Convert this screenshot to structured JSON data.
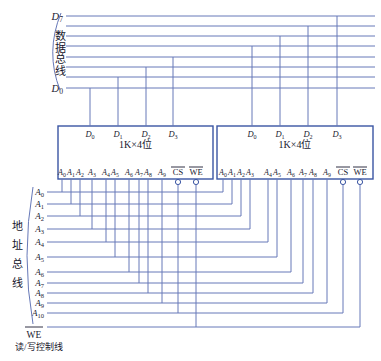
{
  "colors": {
    "background": "#ffffff",
    "wire": "#6678b8",
    "box": "#3a55a3",
    "text": "#1a1a30"
  },
  "data_bus": {
    "label": "数据总线",
    "lines": [
      "D7",
      "D6",
      "D5",
      "D4",
      "D3",
      "D2",
      "D1",
      "D0"
    ],
    "top_line_label": "D7",
    "bottom_line_label": "D0"
  },
  "address_bus": {
    "label": "地址总线",
    "lines": [
      "A0",
      "A1",
      "A2",
      "A3",
      "A4",
      "A5",
      "A6",
      "A7",
      "A8",
      "A9",
      "A10"
    ]
  },
  "control_line": {
    "label": "WE",
    "caption": "读/写控制线"
  },
  "chips": [
    {
      "title": "1K×4位",
      "top_pins": [
        "D0",
        "D1",
        "D2",
        "D3"
      ],
      "address_pins": [
        "A0",
        "A1",
        "A2",
        "A3",
        "A4",
        "A5",
        "A6",
        "A7",
        "A8",
        "A9"
      ],
      "control_pins": [
        "CS",
        "WE"
      ],
      "top_pin_nets": [
        "D0",
        "D1",
        "D2",
        "D3"
      ],
      "cs_net": "A10",
      "we_net": "WE"
    },
    {
      "title": "1K×4位",
      "top_pins": [
        "D0",
        "D1",
        "D2",
        "D3"
      ],
      "address_pins": [
        "A0",
        "A1",
        "A2",
        "A3",
        "A4",
        "A5",
        "A6",
        "A7",
        "A8",
        "A9"
      ],
      "control_pins": [
        "CS",
        "WE"
      ],
      "top_pin_nets": [
        "D4",
        "D5",
        "D6",
        "D7"
      ],
      "cs_net": "A10",
      "we_net": "WE"
    }
  ]
}
